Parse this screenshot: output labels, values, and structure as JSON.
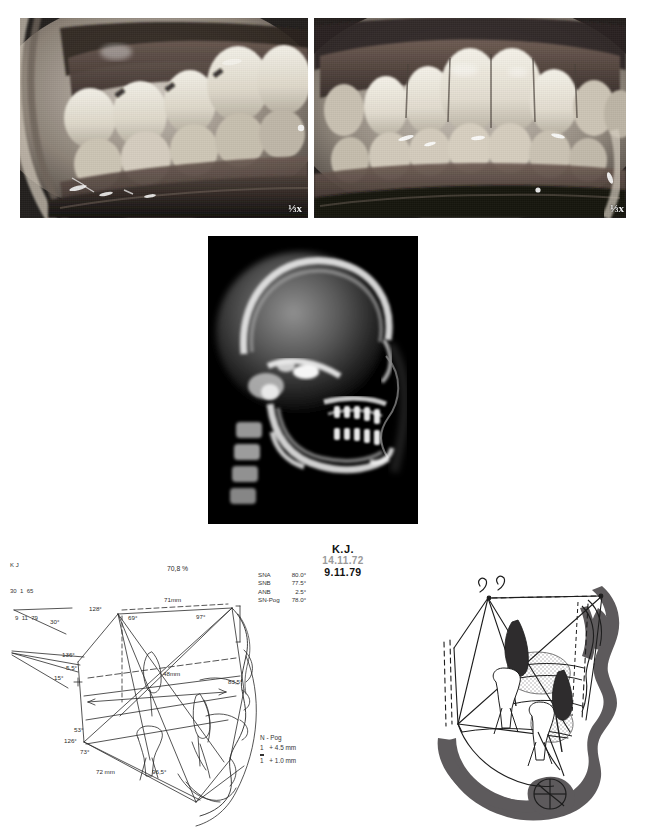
{
  "page": {
    "kind": "orthodontic-case-plate",
    "width": 647,
    "height": 830
  },
  "photos": [
    {
      "name": "intraoral-lateral-right-buccal",
      "caption": "",
      "scale_mark": "⅓x"
    },
    {
      "name": "intraoral-frontal",
      "caption": "",
      "scale_mark": "⅓x"
    }
  ],
  "radiograph": {
    "name": "lateral-cephalometric-radiograph",
    "caption": ""
  },
  "patient": {
    "initials": "K.J.",
    "date_initial": "14.11.72",
    "date_followup": "9.11.79"
  },
  "id_block": {
    "line1": "K J",
    "line2": "30  1  65",
    "line3": "9  11  79"
  },
  "measurements": {
    "title": "",
    "rows": [
      {
        "label": "SNA",
        "value": "80.0°"
      },
      {
        "label": "SNB",
        "value": "77.5°"
      },
      {
        "label": "ANB",
        "value": "2.5°"
      },
      {
        "label": "SN-Pog",
        "value": "78.0°"
      }
    ]
  },
  "npog": {
    "title": "N - Pog",
    "rows": [
      {
        "tooth": "1",
        "marker": "overbar",
        "value": "+ 4.5 mm"
      },
      {
        "tooth": "1",
        "marker": "underbar",
        "value": "+ 1.0 mm"
      }
    ]
  },
  "tracing_labels": {
    "percent": "70,8 %",
    "upper_len": "71mm",
    "mid_len": "48mm",
    "lower_len": "72 mm",
    "a_128": "128°",
    "a_69": "69°",
    "a_97": "97°",
    "a_30": "30°",
    "a_136": "136°",
    "a_55": "5,5°",
    "a_15": "15°",
    "a_835": "83,5°",
    "a_53": "53°",
    "a_126": "126°",
    "a_73": "73°",
    "a_965": "96,5°"
  },
  "superimposition": {
    "name": "superimposed-cephalometric-tracing",
    "caption": ""
  },
  "colors": {
    "ink": "#2a2a2a",
    "soft_tissue_fill": "#5d5a5c",
    "bone_stipple": "#d8d6d7",
    "photo_bg": "#2b2b2b",
    "xray_bg": "#000000",
    "date_old": "#9a9a9a"
  }
}
